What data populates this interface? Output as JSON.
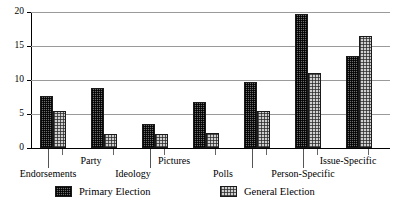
{
  "chart_data": {
    "type": "bar",
    "title": "",
    "subtitle": "",
    "xlabel": "",
    "ylabel": "",
    "ylim": [
      0,
      20
    ],
    "yticks": [
      "0",
      "5",
      "10",
      "15",
      "20"
    ],
    "ytick_values": [
      0,
      5,
      10,
      15,
      20
    ],
    "grid": true,
    "legend_position": "bottom",
    "categories": [
      "Endorsements",
      "Party",
      "Ideology",
      "Pictures",
      "Polls",
      "Person-Specific",
      "Issue-Specific"
    ],
    "series": [
      {
        "name": "Primary Election",
        "values": [
          7.7,
          8.8,
          3.5,
          6.7,
          9.7,
          19.7,
          13.6
        ]
      },
      {
        "name": "General Election",
        "values": [
          5.4,
          2.0,
          2.0,
          2.2,
          5.4,
          11.1,
          16.4
        ]
      }
    ]
  },
  "legend": {
    "entries": [
      {
        "label": "Primary Election",
        "swatch": "primary"
      },
      {
        "label": "General Election",
        "swatch": "general"
      }
    ]
  }
}
